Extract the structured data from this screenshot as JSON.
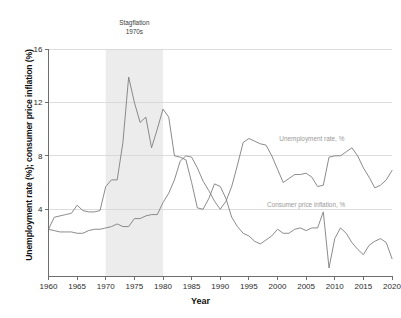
{
  "chart_data": {
    "type": "line",
    "title": "",
    "xlabel": "Year",
    "ylabel": "Unemployment rate (%); consumer price inflation (%)",
    "xlim": [
      1960,
      2020
    ],
    "ylim": [
      -1,
      16
    ],
    "xticks": [
      1960,
      1965,
      1970,
      1975,
      1980,
      1985,
      1990,
      1995,
      2000,
      2005,
      2010,
      2015,
      2020
    ],
    "yticks": [
      4,
      8,
      12,
      16
    ],
    "grid": "horizontal",
    "legend_position": "inline-right",
    "x": [
      1960,
      1961,
      1962,
      1963,
      1964,
      1965,
      1966,
      1967,
      1968,
      1969,
      1970,
      1971,
      1972,
      1973,
      1974,
      1975,
      1976,
      1977,
      1978,
      1979,
      1980,
      1981,
      1982,
      1983,
      1984,
      1985,
      1986,
      1987,
      1988,
      1989,
      1990,
      1991,
      1992,
      1993,
      1994,
      1995,
      1996,
      1997,
      1998,
      1999,
      2000,
      2001,
      2002,
      2003,
      2004,
      2005,
      2006,
      2007,
      2008,
      2009,
      2010,
      2011,
      2012,
      2013,
      2014,
      2015,
      2016,
      2017,
      2018,
      2019,
      2020
    ],
    "series": [
      {
        "name": "Unemployment rate, %",
        "label": "Unemployment rate, %",
        "color": "#7e7e7e",
        "label_x": 2006,
        "label_y": 9.1,
        "values": [
          2.5,
          2.4,
          2.3,
          2.3,
          2.3,
          2.2,
          2.2,
          2.4,
          2.5,
          2.5,
          2.6,
          2.7,
          2.9,
          2.7,
          2.7,
          3.3,
          3.3,
          3.5,
          3.6,
          3.6,
          4.5,
          5.2,
          6.2,
          7.6,
          8.0,
          7.9,
          7.1,
          6.1,
          5.4,
          4.6,
          4.0,
          4.6,
          5.7,
          7.3,
          9.0,
          9.3,
          9.1,
          8.9,
          8.8,
          8.0,
          7.0,
          6.0,
          6.3,
          6.6,
          6.6,
          6.7,
          6.4,
          5.7,
          5.8,
          7.9,
          8.0,
          8.0,
          8.3,
          8.6,
          8.0,
          7.1,
          6.4,
          5.6,
          5.8,
          6.2,
          6.9
        ]
      },
      {
        "name": "Consumer price inflation, %",
        "label": "Consumer price inflation, %",
        "color": "#7e7e7e",
        "label_x": 2005,
        "label_y": 4.2,
        "values": [
          2.5,
          3.4,
          3.5,
          3.6,
          3.7,
          4.3,
          3.9,
          3.8,
          3.8,
          3.9,
          5.7,
          6.2,
          6.2,
          9.0,
          13.9,
          12.0,
          10.5,
          10.9,
          8.6,
          10.0,
          11.5,
          10.9,
          8.0,
          7.9,
          7.7,
          6.0,
          4.1,
          4.0,
          4.8,
          5.9,
          5.7,
          4.8,
          3.4,
          2.7,
          2.2,
          2.0,
          1.6,
          1.4,
          1.7,
          2.0,
          2.5,
          2.2,
          2.2,
          2.5,
          2.6,
          2.4,
          2.6,
          2.6,
          3.8,
          -0.4,
          1.8,
          2.6,
          2.2,
          1.5,
          1.0,
          0.6,
          1.3,
          1.6,
          1.8,
          1.5,
          0.3
        ]
      }
    ],
    "annotations": [
      {
        "name": "stagflation-band",
        "label_line1": "Stagflation",
        "label_line2": "1970s",
        "x_start": 1970,
        "x_end": 1980,
        "band_color": "#ececec"
      }
    ]
  }
}
